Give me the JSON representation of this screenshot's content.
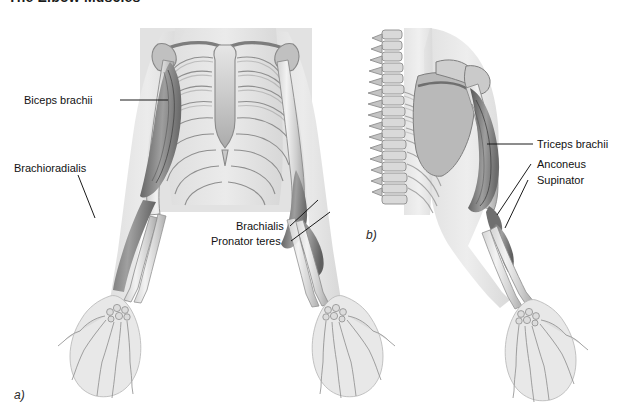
{
  "title": "The Elbow Muscles",
  "panels": [
    {
      "id": "a",
      "caption": "a)",
      "view": "anterior"
    },
    {
      "id": "b",
      "caption": "b)",
      "view": "posterior"
    }
  ],
  "labels": {
    "biceps_brachii": "Biceps brachii",
    "brachioradialis": "Brachioradialis",
    "brachialis": "Brachialis",
    "pronator_teres": "Pronator teres",
    "triceps_brachii": "Triceps brachii",
    "anconeus": "Anconeus",
    "supinator": "Supinator"
  },
  "colors": {
    "background": "#ffffff",
    "text": "#121212",
    "leader_line": "#1a1a1a",
    "bone_light": "#e9e9e9",
    "bone_mid": "#c6c6c6",
    "bone_outline": "#8d8d8d",
    "muscle_dark": "#5a5a5a",
    "muscle_mid": "#8a8a8a",
    "muscle_light": "#b4b4b4",
    "body_tint": "#e4e4e4",
    "torso_block": "#e0e0e0"
  }
}
